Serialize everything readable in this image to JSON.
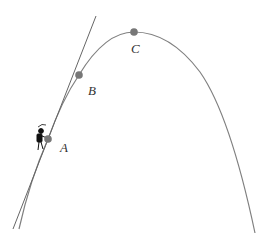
{
  "diagram": {
    "points": [
      {
        "id": "A",
        "label": "A"
      },
      {
        "id": "B",
        "label": "B"
      },
      {
        "id": "C",
        "label": "C"
      }
    ],
    "elements": {
      "curve": "parabola",
      "tangent": "tangent line through A",
      "figure": "climbing-figure"
    },
    "colors": {
      "curve": "#808080",
      "line": "#666666",
      "point": "#777777",
      "label": "#333333"
    }
  }
}
